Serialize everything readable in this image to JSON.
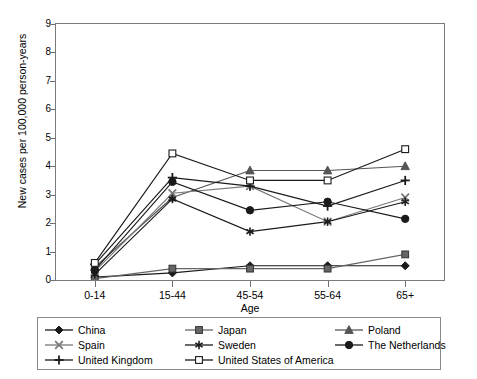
{
  "chart_data": {
    "type": "line",
    "title": "",
    "xlabel": "Age",
    "ylabel": "New cases per 100,000 person-years",
    "categories": [
      "0-14",
      "15-44",
      "45-54",
      "55-64",
      "65+"
    ],
    "ylim": [
      0,
      9
    ],
    "yticks": [
      0,
      1,
      2,
      3,
      4,
      5,
      6,
      7,
      8,
      9
    ],
    "grid": false,
    "legend_position": "bottom",
    "series": [
      {
        "name": "China",
        "marker": "filled-diamond",
        "color": "#1a1a1a",
        "values": [
          0.1,
          0.25,
          0.5,
          0.5,
          0.5
        ]
      },
      {
        "name": "Japan",
        "marker": "filled-square",
        "color": "#666666",
        "values": [
          0.05,
          0.4,
          0.4,
          0.4,
          0.9
        ]
      },
      {
        "name": "Poland",
        "marker": "filled-triangle",
        "color": "#555555",
        "values": [
          0.45,
          2.9,
          3.85,
          3.85,
          4.0
        ]
      },
      {
        "name": "Spain",
        "marker": "x-cross",
        "color": "#777777",
        "values": [
          0.3,
          3.05,
          3.3,
          2.05,
          2.9
        ]
      },
      {
        "name": "Sweden",
        "marker": "asterisk",
        "color": "#1a1a1a",
        "values": [
          0.2,
          2.85,
          1.7,
          2.05,
          2.75
        ]
      },
      {
        "name": "The Netherlands",
        "marker": "filled-circle",
        "color": "#1a1a1a",
        "values": [
          0.35,
          3.45,
          2.45,
          2.75,
          2.15
        ]
      },
      {
        "name": "United Kingdom",
        "marker": "plus",
        "color": "#1a1a1a",
        "values": [
          0.55,
          3.6,
          3.3,
          2.6,
          3.5
        ]
      },
      {
        "name": "United States of America",
        "marker": "open-square",
        "color": "#1a1a1a",
        "values": [
          0.6,
          4.45,
          3.5,
          3.5,
          4.6
        ]
      }
    ]
  },
  "axis": {
    "y_title": "New cases per 100,000 person-years",
    "x_title": "Age"
  }
}
